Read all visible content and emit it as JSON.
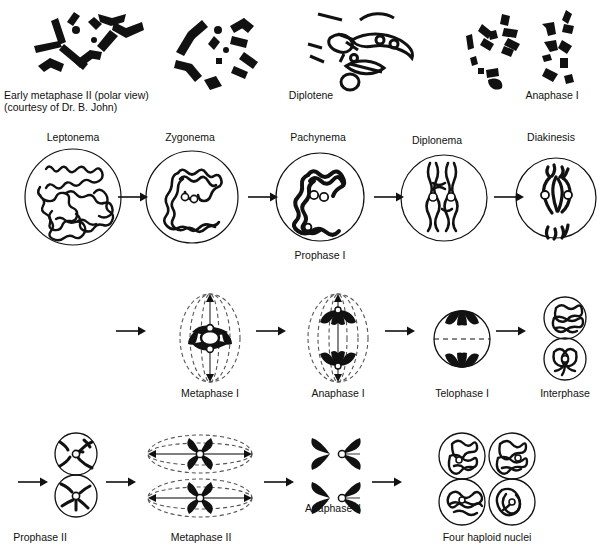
{
  "figure": {
    "title_caption": "Early metaphase II (polar view)",
    "credit": "(courtesy of Dr. B. John)"
  },
  "micrographs": [
    {
      "name": "early-metaphase-ii",
      "label": "Early metaphase II (polar view)",
      "credit": "(courtesy of Dr. B. John)"
    },
    {
      "name": "diplotene",
      "label": "Diplotene",
      "credit": ""
    },
    {
      "name": "anaphase-i-micrograph",
      "label": "Anaphase I",
      "credit": ""
    }
  ],
  "rows": {
    "prophase_i": {
      "group_label": "Prophase I",
      "stages": [
        {
          "label": "Leptonema"
        },
        {
          "label": "Zygonema"
        },
        {
          "label": "Pachynema"
        },
        {
          "label": "Diplonema"
        },
        {
          "label": "Diakinesis"
        }
      ]
    },
    "division_i": {
      "stages": [
        {
          "label": "Metaphase I"
        },
        {
          "label": "Anaphase I"
        },
        {
          "label": "Telophase I"
        },
        {
          "label": "Interphase"
        }
      ]
    },
    "division_ii": {
      "stages": [
        {
          "label": "Prophase II"
        },
        {
          "label": "Metaphase II"
        },
        {
          "label": "Anaphase II"
        },
        {
          "label": "Four haploid nuclei"
        }
      ]
    }
  },
  "colors": {
    "ink": "#111111",
    "background": "#ffffff",
    "chromosome_fill": "#111111",
    "spindle_dash": "#555555"
  }
}
